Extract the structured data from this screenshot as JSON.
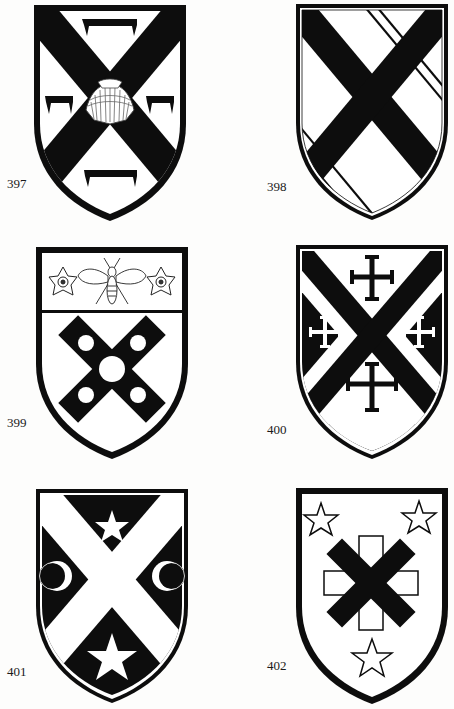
{
  "page": {
    "background": "#fdfdfc",
    "ink": "#0d0d0d",
    "field": "#ffffff"
  },
  "shields": [
    {
      "number": "397",
      "description": "Saltire with scallop shell at centre and four chevronel-like brackets in the quarters",
      "field": "white",
      "ordinary": "saltire sable",
      "charges": [
        "scallop-shell",
        "bracket-top",
        "bracket-left",
        "bracket-right",
        "bracket-bottom"
      ]
    },
    {
      "number": "398",
      "description": "Saltire sable with diagonal cotises/bendlets in the quarters",
      "field": "white",
      "ordinary": "saltire sable",
      "charges": [
        "bendlets-top-right",
        "bendlets-left",
        "bendlets-right",
        "bendlets-bottom"
      ]
    },
    {
      "number": "399",
      "description": "Chief with two roses and a bee; saltire couped with five roundels",
      "field": "white",
      "ordinary": "saltire couped sable with roundels",
      "chief_charges": [
        "rose",
        "bee",
        "rose"
      ],
      "charges": [
        "roundel",
        "roundel",
        "roundel",
        "roundel",
        "roundel"
      ]
    },
    {
      "number": "400",
      "description": "Black field with white saltire fimbriated; four crosses crosslet",
      "field": "sable",
      "ordinary": "saltire sable fimbriated argent",
      "charges": [
        "cross-crosslet-top",
        "cross-crosslet-left",
        "cross-crosslet-right",
        "cross-crosslet-bottom"
      ]
    },
    {
      "number": "401",
      "description": "Black field with white saltire; two stars and two crescents",
      "field": "sable",
      "ordinary": "saltire argent",
      "charges": [
        "star-top",
        "crescent-left",
        "crescent-right",
        "star-bottom"
      ]
    },
    {
      "number": "402",
      "description": "White field with black saltire over a white cross outline; three stars",
      "field": "white",
      "ordinary": "saltire sable over cross argent",
      "charges": [
        "star-top-left",
        "star-top-right",
        "star-bottom"
      ]
    }
  ]
}
